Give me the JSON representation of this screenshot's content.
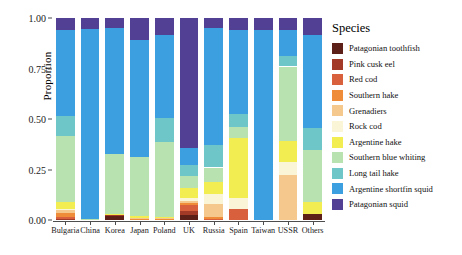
{
  "chart_data": {
    "type": "bar",
    "stacked": true,
    "title": "",
    "xlabel": "",
    "ylabel": "Proportion",
    "ylim": [
      0,
      1
    ],
    "yticks": [
      "0.00",
      "0.25",
      "0.50",
      "0.75",
      "1.00"
    ],
    "ytick_values": [
      0,
      0.25,
      0.5,
      0.75,
      1
    ],
    "grid": false,
    "legend_title": "Species",
    "legend_position": "right",
    "categories": [
      "Bulgaria",
      "China",
      "Korea",
      "Japan",
      "Poland",
      "UK",
      "Russia",
      "Spain",
      "Taiwan",
      "USSR",
      "Others"
    ],
    "series": [
      {
        "name": "Patagonian toothfish",
        "color": "#5C2018",
        "values": [
          0.0,
          0.0,
          0.02,
          0.0,
          0.0,
          0.025,
          0.0,
          0.0,
          0.0,
          0.0,
          0.03
        ]
      },
      {
        "name": "Pink cusk eel",
        "color": "#A33A28",
        "values": [
          0.005,
          0.0,
          0.005,
          0.0,
          0.0,
          0.02,
          0.0,
          0.0,
          0.0,
          0.0,
          0.0
        ]
      },
      {
        "name": "Red cod",
        "color": "#D9603C",
        "values": [
          0.01,
          0.0,
          0.0,
          0.0,
          0.0,
          0.03,
          0.005,
          0.055,
          0.0,
          0.0,
          0.0
        ]
      },
      {
        "name": "Southern hake",
        "color": "#EE8C3A",
        "values": [
          0.02,
          0.0,
          0.0,
          0.005,
          0.005,
          0.01,
          0.01,
          0.0,
          0.0,
          0.0,
          0.0
        ]
      },
      {
        "name": "Grenadiers",
        "color": "#F5C98E",
        "values": [
          0.015,
          0.0,
          0.0,
          0.005,
          0.005,
          0.01,
          0.065,
          0.0,
          0.0,
          0.225,
          0.0
        ]
      },
      {
        "name": "Rock cod",
        "color": "#FAF5D7",
        "values": [
          0.005,
          0.0,
          0.0,
          0.0,
          0.0,
          0.015,
          0.05,
          0.055,
          0.0,
          0.06,
          0.0
        ]
      },
      {
        "name": "Argentine hake",
        "color": "#F2EE52",
        "values": [
          0.035,
          0.0,
          0.005,
          0.01,
          0.005,
          0.05,
          0.06,
          0.295,
          0.0,
          0.105,
          0.06
        ]
      },
      {
        "name": "Southern blue whiting",
        "color": "#B8E2B0",
        "values": [
          0.325,
          0.005,
          0.295,
          0.29,
          0.37,
          0.06,
          0.07,
          0.055,
          0.0,
          0.37,
          0.255
        ]
      },
      {
        "name": "Long tail hake",
        "color": "#6FC6C9",
        "values": [
          0.1,
          0.0,
          0.0,
          0.0,
          0.12,
          0.05,
          0.11,
          0.065,
          0.0,
          0.05,
          0.11
        ]
      },
      {
        "name": "Argentine shortfin squid",
        "color": "#3C9FE0",
        "values": [
          0.425,
          0.94,
          0.625,
          0.58,
          0.41,
          0.085,
          0.58,
          0.415,
          0.94,
          0.13,
          0.46
        ]
      },
      {
        "name": "Patagonian squid",
        "color": "#514093",
        "values": [
          0.06,
          0.055,
          0.05,
          0.11,
          0.085,
          0.645,
          0.05,
          0.06,
          0.06,
          0.06,
          0.085
        ]
      }
    ]
  }
}
